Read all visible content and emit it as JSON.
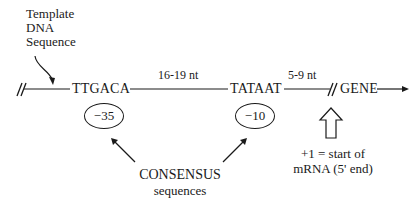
{
  "diagram": {
    "template_label": [
      "Template",
      "DNA",
      "Sequence"
    ],
    "minus35": {
      "sequence": "TTGACA",
      "position": "−35"
    },
    "spacer1": "16-19 nt",
    "minus10": {
      "sequence": "TATAAT",
      "position": "−10"
    },
    "spacer2": "5-9 nt",
    "gene": "GENE",
    "consensus": {
      "title": "CONSENSUS",
      "subtitle": "sequences"
    },
    "start_note": [
      "+1 = start of",
      "mRNA (5' end)"
    ]
  }
}
